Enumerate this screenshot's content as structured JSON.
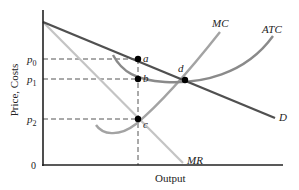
{
  "diagram": {
    "type": "economics-monopoly-pricing",
    "axes": {
      "y_label": "Price, Costs",
      "x_label": "Output",
      "origin_label": "0"
    },
    "price_levels": [
      {
        "name": "p0",
        "base": "p",
        "sub": "0",
        "point": "a"
      },
      {
        "name": "p1",
        "base": "p",
        "sub": "1",
        "point": "b"
      },
      {
        "name": "p2",
        "base": "p",
        "sub": "2",
        "point": "c"
      }
    ],
    "curves": [
      {
        "label": "MC",
        "meaning": "Marginal Cost",
        "color": "#9a9a9a"
      },
      {
        "label": "ATC",
        "meaning": "Average Total Cost",
        "color": "#8a8a8a"
      },
      {
        "label": "D",
        "meaning": "Demand",
        "color": "#555555"
      },
      {
        "label": "MR",
        "meaning": "Marginal Revenue",
        "color": "#bdbdbd"
      }
    ],
    "points": [
      {
        "label": "a",
        "on": "D at chosen output"
      },
      {
        "label": "b",
        "on": "ATC at chosen output"
      },
      {
        "label": "c",
        "on": "MC = MR"
      },
      {
        "label": "d",
        "on": "D intersects ATC"
      }
    ]
  },
  "labels": {
    "y_axis": "Price, Costs",
    "x_axis": "Output",
    "zero": "0",
    "p": "p",
    "sub0": "0",
    "sub1": "1",
    "sub2": "2",
    "mc": "MC",
    "atc": "ATC",
    "d": "D",
    "mr": "MR",
    "a": "a",
    "b": "b",
    "c": "c",
    "pd": "d"
  }
}
